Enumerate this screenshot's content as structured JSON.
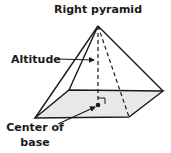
{
  "title": "Right pyramid",
  "labels": {
    "altitude": "Altitude",
    "center_line1": "Center of",
    "center_line2": "base"
  },
  "colors": {
    "stroke": "#1a1a1a",
    "base_fill": "#e8e8e8",
    "background": "#ffffff"
  },
  "geometry": {
    "apex": [
      98,
      26
    ],
    "base_back_left": [
      69,
      90
    ],
    "base_back_right": [
      163,
      91
    ],
    "base_front_right": [
      129,
      117
    ],
    "base_front_left": [
      35,
      118
    ],
    "base_center": [
      98,
      105
    ]
  }
}
